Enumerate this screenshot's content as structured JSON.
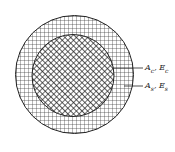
{
  "diagram": {
    "type": "composite cross-section",
    "labels": [
      {
        "id": "core",
        "text": "A",
        "sub": "c",
        "text2": ", E",
        "sub2": "c"
      },
      {
        "id": "shell",
        "text": "A",
        "sub": "s",
        "text2": ", E",
        "sub2": "s"
      }
    ],
    "regions": [
      {
        "name": "core",
        "pattern": "diagonal crosshatch"
      },
      {
        "name": "shell",
        "pattern": "square grid"
      }
    ]
  }
}
